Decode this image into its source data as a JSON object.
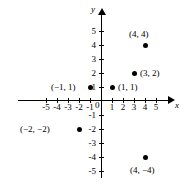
{
  "figure": {
    "type": "coordinate-plane",
    "axis_x_name": "x",
    "axis_y_name": "y",
    "origin_label": "0"
  },
  "chart_data": {
    "type": "scatter",
    "title": "",
    "xlabel": "x",
    "ylabel": "y",
    "xlim": [
      -5.5,
      5.5
    ],
    "ylim": [
      -5.5,
      5.5
    ],
    "grid": false,
    "legend": null,
    "xticks": [
      -5,
      -4,
      -3,
      -2,
      -1,
      1,
      2,
      3,
      4,
      5
    ],
    "xtick_labels": [
      "-5",
      "-4",
      "-3",
      "-2",
      "-1",
      "1",
      "2",
      "3",
      "4",
      "5"
    ],
    "yticks": [
      5,
      4,
      3,
      2,
      1,
      -1,
      -2,
      -3,
      -4,
      -5
    ],
    "ytick_labels": [
      "5",
      "4",
      "3",
      "2",
      "1",
      "-1",
      "-2",
      "-3",
      "-4",
      "-5"
    ],
    "points": [
      {
        "x": 4,
        "y": 4,
        "label": "(4, 4)",
        "label_position": "above"
      },
      {
        "x": 3,
        "y": 2,
        "label": "(3, 2)",
        "label_position": "right"
      },
      {
        "x": 1,
        "y": 1,
        "label": "(1, 1)",
        "label_position": "right"
      },
      {
        "x": -1,
        "y": 1,
        "label": "(−1, 1)",
        "label_position": "left"
      },
      {
        "x": -2,
        "y": -2,
        "label": "(−2, −2)",
        "label_position": "left"
      },
      {
        "x": 4,
        "y": -4,
        "label": "(4, −4)",
        "label_position": "below"
      }
    ]
  },
  "ticks": {
    "x": [
      {
        "label": "-5",
        "left": 46
      },
      {
        "label": "-4",
        "left": 57
      },
      {
        "label": "-3",
        "left": 68
      },
      {
        "label": "-2",
        "left": 79
      },
      {
        "label": "-1",
        "left": 90
      },
      {
        "label": "1",
        "left": 112
      },
      {
        "label": "2",
        "left": 123
      },
      {
        "label": "3",
        "left": 134
      },
      {
        "label": "4",
        "left": 145
      },
      {
        "label": "5",
        "left": 156
      }
    ],
    "y": [
      {
        "label": "5",
        "top": 31
      },
      {
        "label": "4",
        "top": 45
      },
      {
        "label": "3",
        "top": 59
      },
      {
        "label": "2",
        "top": 73
      },
      {
        "label": "1",
        "top": 87
      },
      {
        "label": "-1",
        "top": 115
      },
      {
        "label": "-2",
        "top": 129
      },
      {
        "label": "-3",
        "top": 143
      },
      {
        "label": "-4",
        "top": 157
      },
      {
        "label": "-5",
        "top": 171
      }
    ]
  },
  "plotted": [
    {
      "name": "point-4-4",
      "label": "(4, 4)",
      "px": 145,
      "py": 45,
      "lx": 129,
      "ly": 30
    },
    {
      "name": "point-3-2",
      "label": "(3, 2)",
      "px": 134,
      "py": 73,
      "lx": 140,
      "ly": 69
    },
    {
      "name": "point-1-1",
      "label": "(1, 1)",
      "px": 112,
      "py": 87,
      "lx": 118,
      "ly": 83
    },
    {
      "name": "point-neg1-1",
      "label": "(−1, 1)",
      "px": 90,
      "py": 87,
      "lx": 51,
      "ly": 83
    },
    {
      "name": "point-neg2-neg2",
      "label": "(−2, −2)",
      "px": 79,
      "py": 129,
      "lx": 20,
      "ly": 125
    },
    {
      "name": "point-4-neg4",
      "label": "(4, −4)",
      "px": 145,
      "py": 157,
      "lx": 130,
      "ly": 166
    }
  ],
  "colors": {
    "axis": "#000000",
    "point": "#000000",
    "background": "#ffffff"
  }
}
